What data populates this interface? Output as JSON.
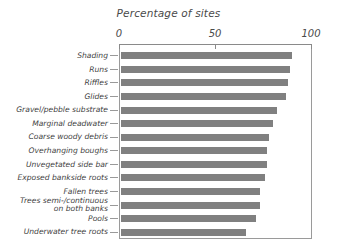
{
  "chart_data": {
    "type": "bar",
    "orientation": "horizontal",
    "title": "Percentage of sites",
    "xlabel": "",
    "ylabel": "",
    "xlim": [
      0,
      100
    ],
    "xticks": [
      0,
      50,
      100
    ],
    "xtick_labels": [
      "0",
      "50",
      "100"
    ],
    "grid": false,
    "legend": false,
    "bar_color": "#808080",
    "categories": [
      "Shading",
      "Runs",
      "Riffles",
      "Glides",
      "Gravel/pebble substrate",
      "Marginal deadwater",
      "Coarse woody debris",
      "Overhanging boughs",
      "Unvegetated side bar",
      "Exposed bankside roots",
      "Fallen trees",
      "Trees semi-/continuous\non both banks",
      "Pools",
      "Underwater tree roots"
    ],
    "values": [
      90,
      89,
      88,
      87,
      82,
      80,
      78,
      77,
      77,
      76,
      73,
      73,
      71,
      66
    ]
  }
}
